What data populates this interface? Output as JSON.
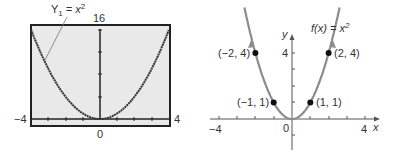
{
  "chart_data": [
    {
      "type": "line",
      "title": "",
      "style": "graphing-calculator-screen",
      "annotation": {
        "name": "Y",
        "subscript": "1",
        "eq": " = x",
        "sup": "2"
      },
      "x_range": [
        -4,
        4
      ],
      "y_range": [
        0,
        16
      ],
      "tick_labels": {
        "xmin": "−4",
        "xmax": "4",
        "x0": "0",
        "ymax": "16"
      },
      "x": [
        -4,
        -3,
        -2,
        -1,
        0,
        1,
        2,
        3,
        4
      ],
      "y": [
        16,
        9,
        4,
        1,
        0,
        1,
        4,
        9,
        16
      ],
      "colors": {
        "screen": "#e9e9e9",
        "curve": "#333333",
        "frame": "#222222"
      }
    },
    {
      "type": "line",
      "title": "",
      "annotation": {
        "fx": "f(x) = x",
        "sup": "2"
      },
      "x_range": [
        -4,
        4
      ],
      "y_range": [
        -2,
        5
      ],
      "axis_labels": {
        "x": "x",
        "y": "y"
      },
      "tick_labels": {
        "xmin": "−4",
        "xmax": "4",
        "origin": "0",
        "y4": "4"
      },
      "points": [
        {
          "x": -2,
          "y": 4,
          "label": "(−2, 4)"
        },
        {
          "x": -1,
          "y": 1,
          "label": "(−1, 1)"
        },
        {
          "x": 1,
          "y": 1,
          "label": "(1, 1)"
        },
        {
          "x": 2,
          "y": 4,
          "label": "(2, 4)"
        }
      ],
      "colors": {
        "curve": "#8c8c8c",
        "points": "#111111",
        "axis": "#555555"
      }
    }
  ]
}
